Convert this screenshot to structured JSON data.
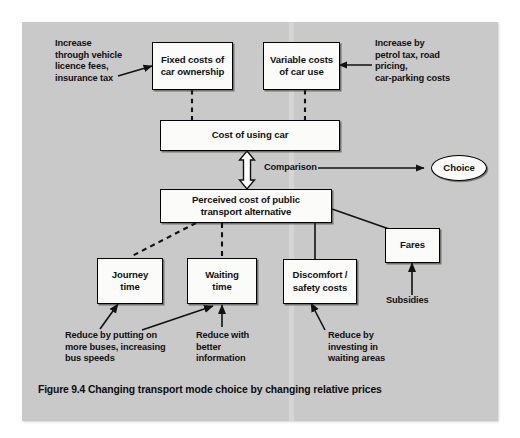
{
  "figure": {
    "label": "Figure 9.4",
    "caption": "Changing transport mode choice by changing relative prices"
  },
  "colors": {
    "panel_background": "#c9c9c9",
    "page_background": "#ffffff",
    "box_fill": "#fbfbfa",
    "stroke": "#000000",
    "text": "#111111"
  },
  "nodes": {
    "fixed_costs": "Fixed costs of\ncar ownership",
    "variable_costs": "Variable costs\nof car use",
    "cost_of_using_car": "Cost of using car",
    "choice": "Choice",
    "perceived_cost": "Perceived cost of public\ntransport alternative",
    "journey_time": "Journey\ntime",
    "waiting_time": "Waiting\ntime",
    "discomfort": "Discomfort /\nsafety costs",
    "fares": "Fares"
  },
  "notes": {
    "increase_vehicle": "Increase\nthrough vehicle\nlicence fees,\ninsurance tax",
    "increase_petrol": "Increase by\npetrol tax, road\npricing,\ncar-parking costs",
    "comparison": "Comparison",
    "subsidies": "Subsidies",
    "reduce_buses": "Reduce by putting on\nmore buses, increasing\nbus speeds",
    "reduce_information": "Reduce with\nbetter\ninformation",
    "reduce_waiting_areas": "Reduce by\ninvesting in\nwaiting areas"
  }
}
